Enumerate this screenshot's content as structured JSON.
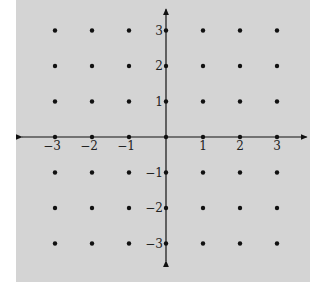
{
  "chart_data": {
    "type": "scatter",
    "title": "",
    "xlabel": "",
    "ylabel": "",
    "xlim": [
      -3.9,
      3.8
    ],
    "ylim": [
      -3.5,
      3.6
    ],
    "x_ticks": [
      -3,
      -2,
      -1,
      1,
      2,
      3
    ],
    "y_ticks": [
      -3,
      -2,
      -1,
      1,
      2,
      3
    ],
    "x_tick_labels": [
      "−3",
      "−2",
      "−1",
      "1",
      "2",
      "3"
    ],
    "y_tick_labels": [
      "−3",
      "−2",
      "−1",
      "1",
      "2",
      "3"
    ],
    "grid": false,
    "points_x_range": [
      -3,
      3
    ],
    "points_y_range": [
      -3,
      3
    ],
    "colors": {
      "background": "#d4d4d4",
      "ink": "#111111"
    }
  }
}
